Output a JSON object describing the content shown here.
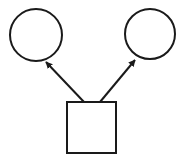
{
  "diagram": {
    "width": 186,
    "height": 161,
    "stroke_color": "#1a1a1a",
    "fill_color": "#ffffff",
    "nodes": [
      {
        "id": "left-circle",
        "shape": "circle",
        "cx": 36,
        "cy": 35,
        "r": 26
      },
      {
        "id": "right-circle",
        "shape": "circle",
        "cx": 150,
        "cy": 34,
        "r": 25
      },
      {
        "id": "square",
        "shape": "rect",
        "x": 67,
        "y": 102,
        "w": 49,
        "h": 51
      }
    ],
    "edges": [
      {
        "from": "square",
        "to": "left-circle",
        "x1": 84,
        "y1": 102,
        "x2": 46,
        "y2": 62,
        "arrow": "end"
      },
      {
        "from": "square",
        "to": "right-circle",
        "x1": 100,
        "y1": 102,
        "x2": 135,
        "y2": 60,
        "arrow": "end"
      }
    ]
  }
}
